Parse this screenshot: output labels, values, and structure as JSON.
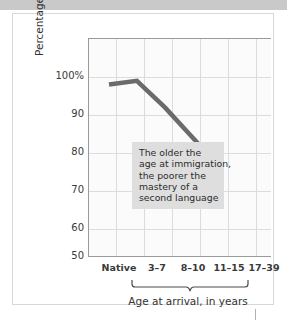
{
  "figure": {
    "background_color": "#ffffff",
    "frame_color": "#d8d8d8",
    "plot_background": "#fbfbfb",
    "grid_color": "#dcdcdc",
    "axis_color": "#9a9a9a"
  },
  "annotation": {
    "background_color": "#dedede",
    "lines": [
      "The older the",
      "age at immigration,",
      "the poorer the",
      "mastery of a",
      "second language"
    ]
  },
  "axis": {
    "y_title": "Percentage correct on grammar test",
    "x_group_title": "Age at arrival, in years",
    "y_tick_labels": [
      "100%",
      "90",
      "80",
      "70",
      "60",
      "50"
    ],
    "x_tick_labels": [
      "Native",
      "3–7",
      "8–10",
      "11–15",
      "17–39"
    ]
  },
  "chart_data": {
    "type": "line",
    "title": "",
    "subtitle": "",
    "xlabel": "Age at arrival, in years",
    "ylabel": "Percentage correct on grammar test",
    "categories": [
      "Native",
      "3–7",
      "8–10",
      "11–15",
      "17–39"
    ],
    "values": [
      98,
      99,
      92,
      84,
      76
    ],
    "series": [
      {
        "name": "Percentage correct on grammar test",
        "values": [
          98,
          99,
          92,
          84,
          76
        ],
        "color": "#6b6b6b"
      }
    ],
    "ylim": [
      50,
      100
    ],
    "yticks": [
      50,
      60,
      70,
      80,
      90,
      100
    ],
    "ytick_labels": [
      "50",
      "60",
      "70",
      "80",
      "90",
      "100%"
    ],
    "xlim": [
      0,
      6
    ],
    "grid": true,
    "grid_axis": "both",
    "legend": false,
    "legend_position": "none",
    "line_color": "#6b6b6b",
    "line_width": 4,
    "markers": false,
    "annotations": [
      {
        "text": "The older the age at immigration, the poorer the mastery of a second language",
        "x_category": "8–10",
        "y_value": 79,
        "background_color": "#dedede"
      }
    ],
    "x_group_bracket": {
      "label": "Age at arrival, in years",
      "spans": [
        "3–7",
        "8–10",
        "11–15",
        "17–39"
      ]
    }
  }
}
